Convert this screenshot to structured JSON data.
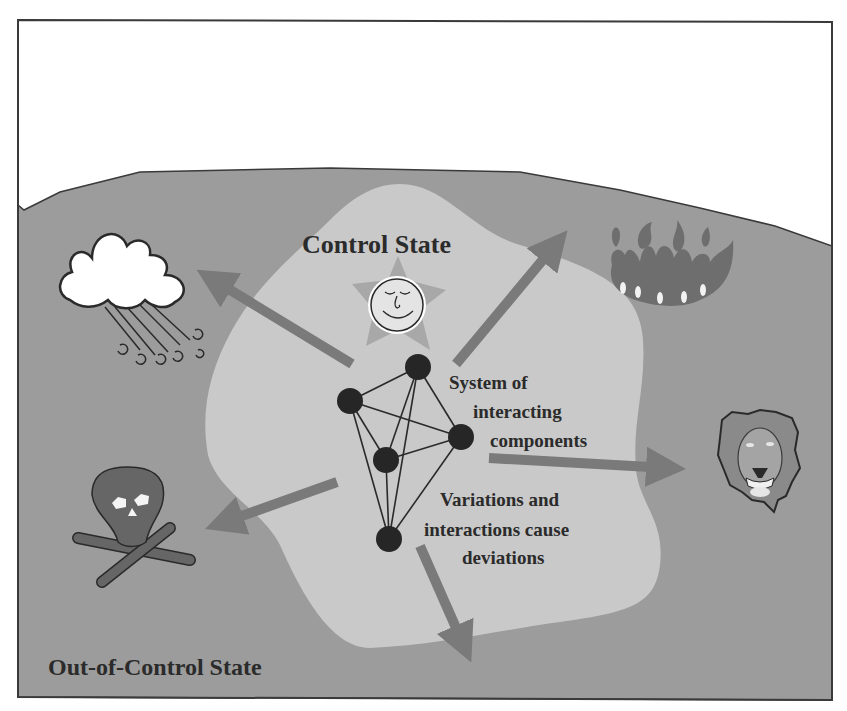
{
  "diagram": {
    "title_control": "Control State",
    "title_out_of_control": "Out-of-Control State",
    "system_label": [
      "System of",
      "interacting",
      "components"
    ],
    "deviation_label": [
      "Variations and",
      "interactions cause",
      "deviations"
    ]
  },
  "colors": {
    "background": "#ffffff",
    "frame": "#3a3a3a",
    "out_of_control_region": "#9c9c9c",
    "control_region": "#c9c9c9",
    "arrow": "#7a7a7a",
    "node": "#262626",
    "text": "#2b2b2b"
  },
  "hazards": [
    {
      "name": "storm",
      "icon": "storm-cloud-icon"
    },
    {
      "name": "fire",
      "icon": "fire-icon"
    },
    {
      "name": "predator",
      "icon": "lion-icon"
    },
    {
      "name": "death",
      "icon": "skull-crossbones-icon"
    }
  ],
  "network": {
    "nodes": [
      {
        "id": "A",
        "x": 418,
        "y": 367
      },
      {
        "id": "B",
        "x": 350,
        "y": 401
      },
      {
        "id": "C",
        "x": 461,
        "y": 437
      },
      {
        "id": "D",
        "x": 386,
        "y": 460
      },
      {
        "id": "E",
        "x": 389,
        "y": 539
      }
    ],
    "edges": [
      [
        "A",
        "B"
      ],
      [
        "A",
        "C"
      ],
      [
        "A",
        "D"
      ],
      [
        "A",
        "E"
      ],
      [
        "B",
        "C"
      ],
      [
        "B",
        "D"
      ],
      [
        "B",
        "E"
      ],
      [
        "D",
        "C"
      ],
      [
        "D",
        "E"
      ],
      [
        "C",
        "E"
      ]
    ]
  }
}
